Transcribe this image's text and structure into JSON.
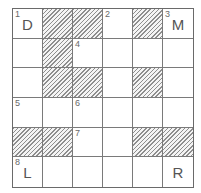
{
  "puzzle": {
    "type": "crossword",
    "rows": 6,
    "cols": 6,
    "cells": [
      [
        {
          "num": "1",
          "letter": "D"
        },
        {
          "shaded": true
        },
        {
          "shaded": true
        },
        {
          "num": "2"
        },
        {
          "shaded": true
        },
        {
          "num": "3",
          "letter": "M"
        }
      ],
      [
        {},
        {
          "shaded": true
        },
        {
          "num": "4"
        },
        {},
        {},
        {}
      ],
      [
        {},
        {
          "shaded": true
        },
        {
          "shaded": true
        },
        {},
        {
          "shaded": true
        },
        {}
      ],
      [
        {
          "num": "5"
        },
        {},
        {
          "num": "6"
        },
        {},
        {},
        {}
      ],
      [
        {
          "shaded": true
        },
        {
          "shaded": true
        },
        {
          "num": "7"
        },
        {},
        {
          "shaded": true
        },
        {
          "shaded": true
        }
      ],
      [
        {
          "num": "8",
          "letter": "L"
        },
        {},
        {},
        {},
        {},
        {
          "letter": "R"
        }
      ]
    ]
  }
}
